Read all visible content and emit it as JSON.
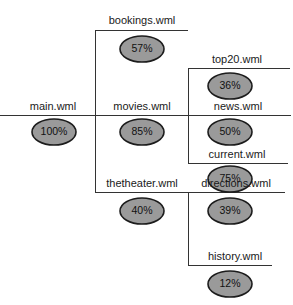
{
  "diagram": {
    "type": "site-hierarchy-tree",
    "title": "",
    "colors": {
      "ellipse_fill": "#9a9a9a",
      "ellipse_stroke": "#1c1c1c",
      "line": "#333333",
      "text": "#1a1a1a",
      "background": "#ffffff"
    },
    "nodes": [
      {
        "id": "main",
        "label": "main.wml",
        "percent": "100%",
        "level": 0
      },
      {
        "id": "bookings",
        "label": "bookings.wml",
        "percent": "57%",
        "level": 1
      },
      {
        "id": "movies",
        "label": "movies.wml",
        "percent": "85%",
        "level": 1
      },
      {
        "id": "thetheater",
        "label": "thetheater.wml",
        "percent": "40%",
        "level": 1
      },
      {
        "id": "top20",
        "label": "top20.wml",
        "percent": "36%",
        "level": 2
      },
      {
        "id": "news",
        "label": "news.wml",
        "percent": "50%",
        "level": 2
      },
      {
        "id": "current",
        "label": "current.wml",
        "percent": "75%",
        "level": 2
      },
      {
        "id": "directions",
        "label": "directions.wml",
        "percent": "39%",
        "level": 2
      },
      {
        "id": "history",
        "label": "history.wml",
        "percent": "12%",
        "level": 2
      }
    ]
  }
}
